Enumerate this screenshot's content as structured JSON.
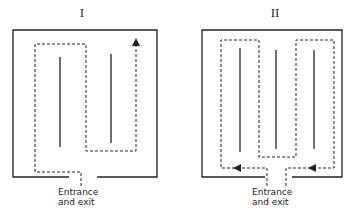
{
  "figure": {
    "panels": [
      {
        "id": "I",
        "title": "I",
        "label_line1": "Entrance",
        "label_line2": "and exit"
      },
      {
        "id": "II",
        "title": "II",
        "label_line1": "Entrance",
        "label_line2": "and exit"
      }
    ]
  }
}
